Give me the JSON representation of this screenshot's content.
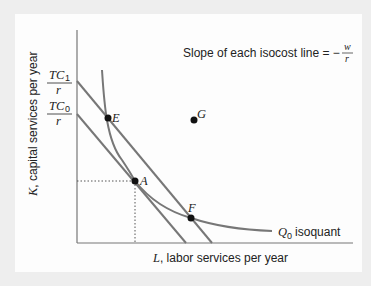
{
  "diagram": {
    "annotation": {
      "text": "Slope of each isocost line = −",
      "fraction_numerator": "w",
      "fraction_denominator": "r"
    },
    "y_axis": {
      "var": "K",
      "label": ", capital services per year",
      "ticks": [
        {
          "numerator_var": "TC",
          "numerator_sub": "1",
          "denominator": "r"
        },
        {
          "numerator_var": "TC",
          "numerator_sub": "0",
          "denominator": "r"
        }
      ]
    },
    "x_axis": {
      "var": "L",
      "label": ", labor services per year"
    },
    "isoquant": {
      "var": "Q",
      "sub": "0",
      "label": "isoquant"
    },
    "points": [
      {
        "id": "E",
        "label": "E"
      },
      {
        "id": "A",
        "label": "A"
      },
      {
        "id": "F",
        "label": "F"
      },
      {
        "id": "G",
        "label": "G"
      }
    ],
    "colors": {
      "line": "#777777",
      "point": "#111111",
      "text": "#222222",
      "background": "#fdfdfd",
      "frame": "#eeeeee"
    }
  }
}
